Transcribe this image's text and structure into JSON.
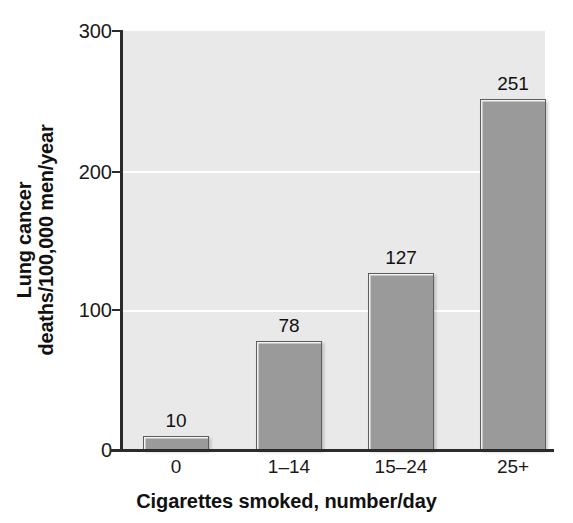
{
  "chart_data": {
    "type": "bar",
    "title": "",
    "subtitle": "",
    "xlabel": "Cigarettes smoked, number/day",
    "ylabel_line1": "Lung cancer",
    "ylabel_line2": "deaths/100,000 men/year",
    "ylabel_full": "Lung cancer deaths/100,000 men/year",
    "categories": [
      "0",
      "1–14",
      "15–24",
      "25+"
    ],
    "values": [
      10,
      78,
      127,
      251
    ],
    "data_labels": [
      "10",
      "78",
      "127",
      "251"
    ],
    "ylim": [
      0,
      300
    ],
    "yticks": [
      0,
      100,
      200,
      300
    ],
    "ytick_labels": [
      "0",
      "100",
      "200",
      "300"
    ],
    "gridlines": [
      100,
      200
    ],
    "grid": true,
    "legend": null,
    "legend_position": "none",
    "colors": {
      "bar_fill": "#9a9a9a",
      "bar_edge": "#5d5d5d",
      "bar_highlight": "#f2f2f2",
      "plot_background": "#e9e9e9",
      "figure_background": "#ffffff",
      "gridline": "#ffffff",
      "axis": "#2b2b2b",
      "text": "#111111"
    }
  }
}
